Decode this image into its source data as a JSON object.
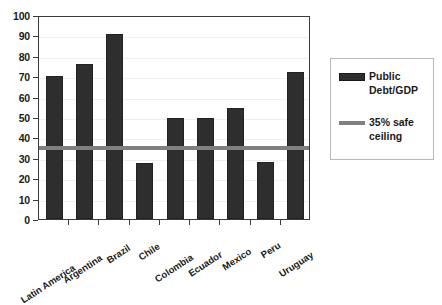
{
  "chart_data": {
    "type": "bar",
    "title": "",
    "xlabel": "",
    "ylabel": "",
    "ylim": [
      0,
      100
    ],
    "ytick_step": 10,
    "yticks": [
      "100",
      "90",
      "80",
      "70",
      "60",
      "50",
      "40",
      "30",
      "20",
      "10",
      "0"
    ],
    "grid": true,
    "legend_position": "right",
    "categories": [
      "Latin America",
      "Argentina",
      "Brazil",
      "Chile",
      "Colombia",
      "Ecuador",
      "Mexico",
      "Peru",
      "Uruguay"
    ],
    "series": [
      {
        "name": "Public Debt/GDP",
        "type": "bar",
        "color": "#2e2e2e",
        "values": [
          70,
          76,
          90.5,
          27.5,
          49.5,
          49.5,
          54.5,
          28,
          72
        ]
      },
      {
        "name": "35% safe ceiling",
        "type": "line",
        "color": "#808080",
        "value": 35
      }
    ]
  },
  "legend": {
    "entries": [
      {
        "label_line1": "Public",
        "label_line2": "Debt/GDP"
      },
      {
        "label_line1": "35% safe",
        "label_line2": "ceiling"
      }
    ]
  },
  "colors": {
    "bar": "#2e2e2e",
    "ceiling_line": "#808080",
    "axis": "#3a3a3a",
    "gridline": "#efefef",
    "text": "#1b1b1b",
    "legend_border": "#b8b8b8",
    "background": "#ffffff"
  }
}
